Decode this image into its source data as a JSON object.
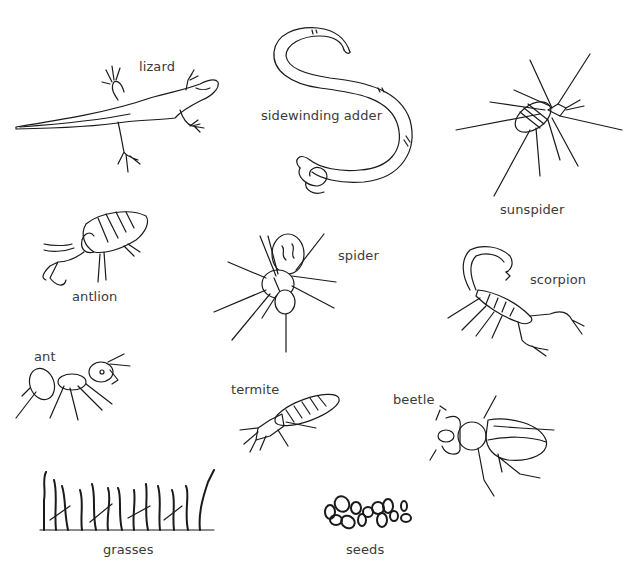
{
  "diagram": {
    "type": "illustrated-organism-set",
    "background": "#ffffff",
    "line_color": "#1a1a1a",
    "label_color": "#3a3a3a",
    "organisms": [
      {
        "id": "lizard",
        "label": "lizard",
        "icon": "lizard-icon"
      },
      {
        "id": "sidewinding-adder",
        "label": "sidewinding adder",
        "icon": "snake-icon"
      },
      {
        "id": "sunspider",
        "label": "sunspider",
        "icon": "sunspider-icon"
      },
      {
        "id": "antlion",
        "label": "antlion",
        "icon": "antlion-icon"
      },
      {
        "id": "spider",
        "label": "spider",
        "icon": "spider-icon"
      },
      {
        "id": "scorpion",
        "label": "scorpion",
        "icon": "scorpion-icon"
      },
      {
        "id": "ant",
        "label": "ant",
        "icon": "ant-icon"
      },
      {
        "id": "termite",
        "label": "termite",
        "icon": "termite-icon"
      },
      {
        "id": "beetle",
        "label": "beetle",
        "icon": "beetle-icon"
      },
      {
        "id": "grasses",
        "label": "grasses",
        "icon": "grass-icon"
      },
      {
        "id": "seeds",
        "label": "seeds",
        "icon": "seeds-icon"
      }
    ]
  }
}
